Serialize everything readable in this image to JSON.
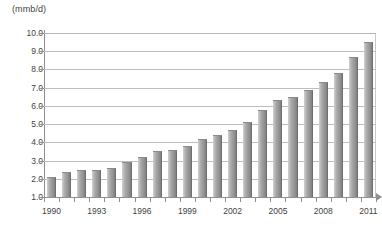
{
  "chart_data": {
    "type": "bar",
    "title": "",
    "subtitle": "",
    "xlabel": "",
    "ylabel": "(mmb/d)",
    "units": "mmb/d",
    "ylim": [
      1.0,
      10.0
    ],
    "ytick_labels": [
      "10.0",
      "9.0",
      "8.0",
      "7.0",
      "6.0",
      "5.0",
      "4.0",
      "3.0",
      "2.0",
      "1.0"
    ],
    "ytick_values": [
      10.0,
      9.0,
      8.0,
      7.0,
      6.0,
      5.0,
      4.0,
      3.0,
      2.0,
      1.0
    ],
    "grid": true,
    "legend": null,
    "legend_position": "none",
    "xtick_labels": [
      "1990",
      "1993",
      "1996",
      "1999",
      "2002",
      "2005",
      "2008",
      "2011"
    ],
    "categories": [
      "1990",
      "1991",
      "1992",
      "1993",
      "1994",
      "1995",
      "1996",
      "1997",
      "1998",
      "1999",
      "2000",
      "2001",
      "2002",
      "2003",
      "2004",
      "2005",
      "2006",
      "2007",
      "2008",
      "2009",
      "2010",
      "2011"
    ],
    "values": [
      2.1,
      2.4,
      2.5,
      2.5,
      2.6,
      2.9,
      3.2,
      3.5,
      3.6,
      3.8,
      4.2,
      4.4,
      4.7,
      5.1,
      5.8,
      6.3,
      6.5,
      6.9,
      7.3,
      7.8,
      8.7,
      9.5
    ],
    "bar_color": "#9a9a9a",
    "grid_color": "#bdbdbd",
    "axis_color": "#8f8f8f",
    "background": "#ffffff"
  }
}
